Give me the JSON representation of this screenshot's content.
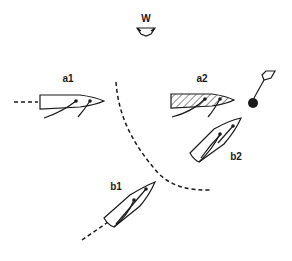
{
  "diagram": {
    "wind": {
      "label": "W",
      "direction": "from top",
      "icon": "wind-arrow-icon"
    },
    "boats": [
      {
        "id": "a1",
        "label": "a1",
        "heading": "east",
        "shaded": false,
        "trail": "dashed line astern"
      },
      {
        "id": "a2",
        "label": "a2",
        "heading": "east",
        "shaded": true
      },
      {
        "id": "b1",
        "label": "b1",
        "heading": "northeast",
        "shaded": false,
        "trail": "dashed line astern"
      },
      {
        "id": "b2",
        "label": "b2",
        "heading": "northeast",
        "shaded": false
      }
    ],
    "mark": {
      "label": "",
      "icon": "mark-flag-icon"
    },
    "zone_boundary": "dashed curved line"
  }
}
